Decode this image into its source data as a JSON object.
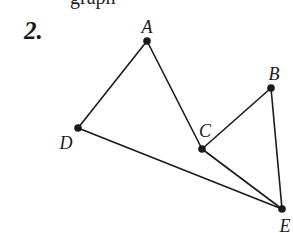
{
  "header": {
    "cropped_text": "graph",
    "problem_number": "2."
  },
  "diagram": {
    "stroke_color": "#1a1a1a",
    "points": [
      {
        "id": "A",
        "label": "A",
        "x": 147,
        "y": 41,
        "lx": 147,
        "ly": 33
      },
      {
        "id": "B",
        "label": "B",
        "x": 271,
        "y": 88,
        "lx": 274,
        "ly": 80
      },
      {
        "id": "C",
        "label": "C",
        "x": 202,
        "y": 149,
        "lx": 205,
        "ly": 137
      },
      {
        "id": "D",
        "label": "D",
        "x": 78,
        "y": 128,
        "lx": 66,
        "ly": 149
      },
      {
        "id": "E",
        "label": "E",
        "x": 282,
        "y": 209,
        "lx": 285,
        "ly": 232
      }
    ],
    "segments": [
      [
        "A",
        "D"
      ],
      [
        "A",
        "C"
      ],
      [
        "C",
        "B"
      ],
      [
        "B",
        "E"
      ],
      [
        "C",
        "E"
      ],
      [
        "D",
        "E"
      ]
    ]
  }
}
